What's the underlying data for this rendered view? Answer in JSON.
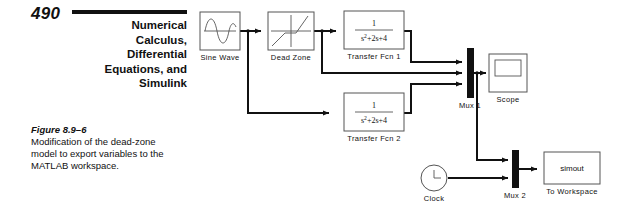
{
  "page": {
    "folio": "490",
    "running_head_lines": [
      "Numerical",
      "Calculus,",
      "Differential",
      "Equations, and",
      "Simulink"
    ]
  },
  "caption": {
    "title": "Figure 8.9–6",
    "body": "Modification of the dead-zone model to export variables to the MATLAB workspace."
  },
  "diagram": {
    "blocks": {
      "sine_wave": {
        "label": "Sine Wave",
        "icon": "sine-wave-icon"
      },
      "dead_zone": {
        "label": "Dead Zone",
        "icon": "dead-zone-icon"
      },
      "transfer_fcn_1": {
        "label": "Transfer Fcn 1",
        "numerator": "1",
        "denominator_base": "s",
        "denominator_exp": "2",
        "denominator_rest": "+2s+4"
      },
      "transfer_fcn_2": {
        "label": "Transfer Fcn 2",
        "numerator": "1",
        "denominator_base": "s",
        "denominator_exp": "2",
        "denominator_rest": "+2s+4"
      },
      "mux_1": {
        "label": "Mux 1",
        "inputs": 3
      },
      "mux_2": {
        "label": "Mux 2",
        "inputs": 2
      },
      "scope": {
        "label": "Scope",
        "icon": "scope-icon"
      },
      "clock": {
        "label": "Clock",
        "icon": "clock-icon"
      },
      "to_workspace": {
        "label": "To Workspace",
        "variable": "simout"
      }
    },
    "colors": {
      "wire": "#111111",
      "block_outline": "#555555",
      "mux_fill": "#111111",
      "background": "#ffffff"
    }
  }
}
